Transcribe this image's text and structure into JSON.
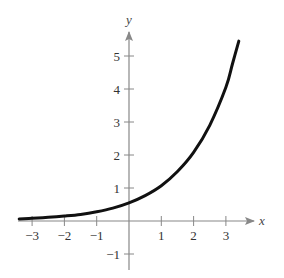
{
  "chart_data": {
    "type": "line",
    "title": "",
    "xlabel": "x",
    "ylabel": "y",
    "xlim": [
      -3.4,
      3.8
    ],
    "ylim": [
      -1.5,
      5.8
    ],
    "grid": false,
    "legend": null,
    "x_ticks": [
      -3,
      -2,
      -1,
      1,
      2,
      3
    ],
    "x_tick_labels": [
      "−3",
      "−2",
      "−1",
      "1",
      "2",
      "3"
    ],
    "y_ticks": [
      -1,
      1,
      2,
      3,
      4,
      5
    ],
    "y_tick_labels": [
      "−1",
      "1",
      "2",
      "3",
      "4",
      "5"
    ],
    "series": [
      {
        "name": "exponential curve",
        "color": "#111111",
        "x": [
          -3.4,
          -3,
          -2.5,
          -2,
          -1.5,
          -1,
          -0.5,
          0,
          0.5,
          1,
          1.5,
          2,
          2.5,
          3,
          3.2,
          3.4
        ],
        "y": [
          0.06,
          0.08,
          0.11,
          0.15,
          0.2,
          0.28,
          0.39,
          0.55,
          0.77,
          1.07,
          1.5,
          2.08,
          2.9,
          4.05,
          4.75,
          5.45
        ]
      }
    ]
  },
  "axes": {
    "x_label": "x",
    "y_label": "y",
    "axis_color": "#888888"
  }
}
